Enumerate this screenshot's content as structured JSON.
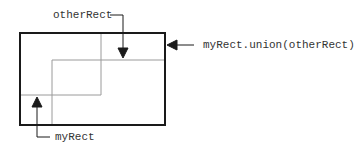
{
  "diagram": {
    "labels": {
      "other_rect": "otherRect",
      "union": "myRect.union(otherRect)",
      "my_rect": "myRect"
    },
    "colors": {
      "union_stroke": "#1a1a1a",
      "inner_stroke": "#9a9a9a",
      "arrow": "#1a1a1a"
    },
    "shapes": {
      "union_rect": {
        "x": 20,
        "y": 33,
        "w": 145,
        "h": 92
      },
      "my_rect": {
        "x": 20,
        "y": 33,
        "w": 81,
        "h": 62
      },
      "other_rect": {
        "x": 52,
        "y": 60,
        "w": 113,
        "h": 65
      }
    }
  }
}
